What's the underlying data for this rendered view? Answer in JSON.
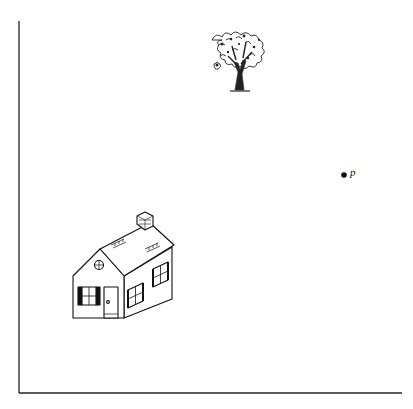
{
  "diagram": {
    "type": "scene-diagram",
    "axes": {
      "vertical": {
        "x": 19,
        "y_top": 21,
        "y_bottom": 393
      },
      "horizontal": {
        "y": 393,
        "x_left": 19,
        "x_right": 402
      }
    },
    "objects": [
      {
        "name": "tree",
        "kind": "illustration",
        "position": {
          "x": 237,
          "y": 55
        }
      },
      {
        "name": "house",
        "kind": "illustration",
        "position": {
          "x": 122,
          "y": 270
        }
      }
    ],
    "point": {
      "label": "p",
      "x": 344,
      "y": 175
    }
  },
  "colors": {
    "ink": "#111111",
    "background": "#ffffff"
  }
}
